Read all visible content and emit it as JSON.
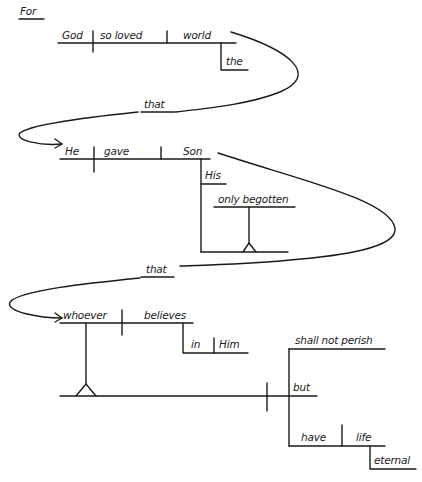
{
  "diagram": {
    "type": "sentence-diagram",
    "sentence": "For God so loved the world that He gave His only begotten Son that whoever believes in Him shall not perish but have eternal life",
    "words": {
      "for": "For",
      "god": "God",
      "so_loved": "so loved",
      "world": "world",
      "the": "the",
      "that_1": "that",
      "he": "He",
      "gave": "gave",
      "son": "Son",
      "his": "His",
      "only_begotten": "only begotten",
      "that_2": "that",
      "whoever": "whoever",
      "believes": "believes",
      "in": "in",
      "him": "Him",
      "shall_not_perish": "shall not perish",
      "but": "but",
      "have": "have",
      "life": "life",
      "eternal": "eternal"
    },
    "clauses": [
      {
        "subject": "God",
        "verb": "so loved",
        "object": "world",
        "modifiers": [
          "the"
        ]
      },
      {
        "connector": "that",
        "subject": "He",
        "verb": "gave",
        "object": "Son",
        "modifiers": [
          "His",
          "only begotten"
        ]
      },
      {
        "connector": "that",
        "subject": "whoever believes in Him",
        "compound_predicate": [
          "shall not perish",
          "have life"
        ],
        "conjunction": "but",
        "modifiers": [
          "eternal"
        ]
      }
    ],
    "colors": {
      "ink": "#1a1a1a",
      "background": "#ffffff"
    }
  }
}
